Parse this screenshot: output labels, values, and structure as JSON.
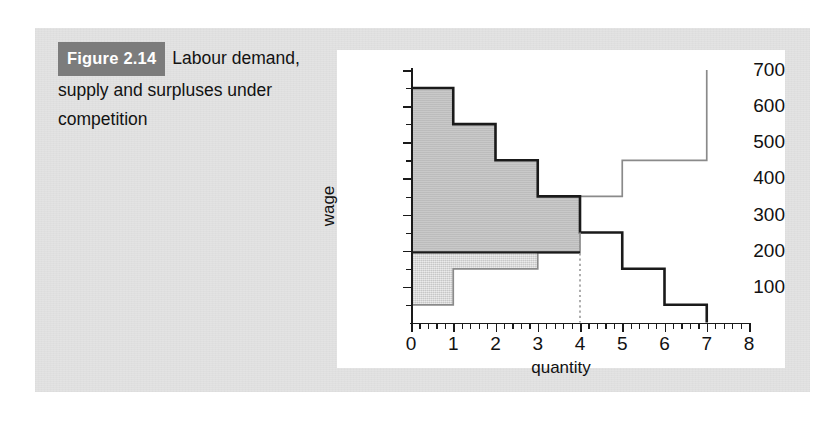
{
  "caption": {
    "figure_label": "Figure 2.14",
    "text": "Labour demand, supply and surpluses under competition"
  },
  "colors": {
    "panel_background": "#e3e3e3",
    "card_background": "#ffffff",
    "figure_label_background": "#7c7c7c",
    "figure_label_text": "#ffffff",
    "employer_surplus_fill": "#c3c3c3",
    "worker_surplus_fill": "#dcdcdc",
    "demand_line": "#1a1a1a",
    "supply_line": "#8a8a8a",
    "equilibrium_line": "#1a1a1a",
    "dotted_line": "#9a9a9a",
    "axis": "#1a1a1a"
  },
  "chart_data": {
    "type": "line",
    "title": "",
    "xlabel": "quantity",
    "ylabel": "wage",
    "xlim": [
      0,
      8
    ],
    "ylim": [
      0,
      700
    ],
    "grid": false,
    "legend": "none",
    "x_ticks": [
      0,
      1,
      2,
      3,
      4,
      5,
      6,
      7,
      8
    ],
    "x_tick_labels": [
      "0",
      "1",
      "2",
      "3",
      "4",
      "5",
      "6",
      "7",
      "8"
    ],
    "x_minor_tick_step": 0.2,
    "y_ticks": [
      100,
      200,
      300,
      400,
      500,
      600,
      700
    ],
    "y_tick_labels": [
      "100",
      "200",
      "300",
      "400",
      "500",
      "600",
      "700"
    ],
    "y_minor_tick_step": 50,
    "series": [
      {
        "name": "labour demand",
        "style": "step",
        "line_color": "#1a1a1a",
        "line_width": 2.6,
        "steps": [
          {
            "x_from": 0,
            "x_to": 1,
            "y": 650
          },
          {
            "x_from": 1,
            "x_to": 2,
            "y": 550
          },
          {
            "x_from": 2,
            "x_to": 3,
            "y": 450
          },
          {
            "x_from": 3,
            "x_to": 4,
            "y": 350
          },
          {
            "x_from": 4,
            "x_to": 5,
            "y": 250
          },
          {
            "x_from": 5,
            "x_to": 6,
            "y": 150
          },
          {
            "x_from": 6,
            "x_to": 7,
            "y": 50
          }
        ]
      },
      {
        "name": "labour supply",
        "style": "step",
        "line_color": "#8a8a8a",
        "line_width": 1.6,
        "steps": [
          {
            "x_from": 0,
            "x_to": 1,
            "y": 50
          },
          {
            "x_from": 1,
            "x_to": 3,
            "y": 150
          },
          {
            "x_from": 3,
            "x_to": 4,
            "y": 250
          },
          {
            "x_from": 4,
            "x_to": 5,
            "y": 350
          },
          {
            "x_from": 5,
            "x_to": 7,
            "y": 450
          },
          {
            "x_from": 7,
            "x_to": 7,
            "y": 700
          }
        ],
        "note": "vertical at quantity 7 rising to 700"
      }
    ],
    "equilibrium": {
      "wage": 300,
      "quantity": 4,
      "wage_line_from_x": 0,
      "wage_line_to_x": 4,
      "dotted_quantity_line_from_y": 0,
      "dotted_quantity_line_to_y": 250
    },
    "shaded_regions": [
      {
        "name": "employer surplus",
        "fill": "#c3c3c3",
        "description": "between demand curve and wage 300, from quantity 0 to 4",
        "bounds": [
          {
            "x_from": 0,
            "x_to": 1,
            "y_top": 650,
            "y_bottom": 300
          },
          {
            "x_from": 1,
            "x_to": 2,
            "y_top": 550,
            "y_bottom": 300
          },
          {
            "x_from": 2,
            "x_to": 3,
            "y_top": 450,
            "y_bottom": 300
          },
          {
            "x_from": 3,
            "x_to": 4,
            "y_top": 350,
            "y_bottom": 300
          }
        ]
      },
      {
        "name": "worker surplus",
        "fill": "#dcdcdc",
        "description": "between wage 300 and supply curve, from quantity 0 to 4",
        "bounds": [
          {
            "x_from": 0,
            "x_to": 1,
            "y_top": 300,
            "y_bottom": 50
          },
          {
            "x_from": 1,
            "x_to": 3,
            "y_top": 300,
            "y_bottom": 150
          },
          {
            "x_from": 3,
            "x_to": 4,
            "y_top": 300,
            "y_bottom": 250
          }
        ]
      }
    ]
  }
}
